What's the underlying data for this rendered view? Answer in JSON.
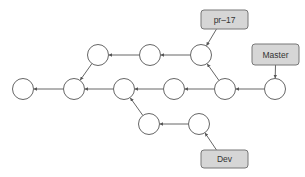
{
  "diagram": {
    "type": "git-commit-graph",
    "colors": {
      "node_stroke": "#666666",
      "node_fill": "#ffffff",
      "edge": "#555555",
      "label_fill": "#d6d6d6",
      "label_stroke": "#777777",
      "label_text": "#333333"
    },
    "node_radius": 10.5,
    "nodes": [
      {
        "id": "c1",
        "x": 23,
        "y": 89
      },
      {
        "id": "c2",
        "x": 74,
        "y": 89
      },
      {
        "id": "c3",
        "x": 98,
        "y": 55
      },
      {
        "id": "c4",
        "x": 150,
        "y": 55
      },
      {
        "id": "c5",
        "x": 201,
        "y": 55
      },
      {
        "id": "c6",
        "x": 124,
        "y": 89
      },
      {
        "id": "c7",
        "x": 174,
        "y": 89
      },
      {
        "id": "c8",
        "x": 225,
        "y": 89
      },
      {
        "id": "c9",
        "x": 275,
        "y": 89
      },
      {
        "id": "c10",
        "x": 149,
        "y": 124
      },
      {
        "id": "c11",
        "x": 199,
        "y": 124
      }
    ],
    "edges": [
      {
        "from": "c2",
        "to": "c1"
      },
      {
        "from": "c3",
        "to": "c2"
      },
      {
        "from": "c4",
        "to": "c3"
      },
      {
        "from": "c5",
        "to": "c4"
      },
      {
        "from": "c6",
        "to": "c2"
      },
      {
        "from": "c7",
        "to": "c6"
      },
      {
        "from": "c8",
        "to": "c7"
      },
      {
        "from": "c8",
        "to": "c5"
      },
      {
        "from": "c9",
        "to": "c8"
      },
      {
        "from": "c10",
        "to": "c6"
      },
      {
        "from": "c11",
        "to": "c10"
      }
    ],
    "labels": [
      {
        "id": "pr17",
        "text": "pr–17",
        "x": 201,
        "y": 10,
        "w": 47,
        "h": 19,
        "points_to": "c5"
      },
      {
        "id": "master",
        "text": "Master",
        "x": 252,
        "y": 44,
        "w": 47,
        "h": 21,
        "points_to": "c9"
      },
      {
        "id": "dev",
        "text": "Dev",
        "x": 201,
        "y": 150,
        "w": 47,
        "h": 18,
        "points_to": "c11"
      }
    ]
  }
}
